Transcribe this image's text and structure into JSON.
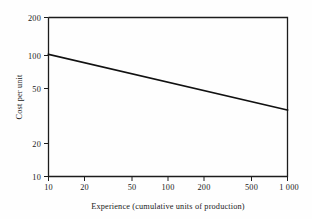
{
  "chart_data": {
    "type": "line",
    "title": "",
    "xlabel": "Experience (cumulative units of production)",
    "ylabel": "Cost per unit",
    "xscale": "log",
    "yscale": "log",
    "xlim": [
      10,
      1000
    ],
    "ylim": [
      10,
      200
    ],
    "grid": false,
    "legend": null,
    "x_ticks": [
      {
        "value": 10,
        "label": "10"
      },
      {
        "value": 20,
        "label": "20"
      },
      {
        "value": 50,
        "label": "50"
      },
      {
        "value": 100,
        "label": "100"
      },
      {
        "value": 200,
        "label": "200"
      },
      {
        "value": 500,
        "label": "500"
      },
      {
        "value": 1000,
        "label": "1 000"
      }
    ],
    "y_ticks": [
      {
        "value": 200,
        "label": "200"
      },
      {
        "value": 100,
        "label": "100"
      },
      {
        "value": 50,
        "label": "50"
      },
      {
        "value": 20,
        "label": "20"
      },
      {
        "value": 10,
        "label": "10"
      }
    ],
    "series": [
      {
        "name": "Experience curve",
        "x": [
          10,
          1000
        ],
        "values": [
          100,
          35
        ]
      }
    ],
    "annotations": []
  },
  "figure": {
    "ylabel_text": "Cost per unit",
    "xlabel_text": "Experience (cumulative units of production)",
    "xtick_0": "10",
    "xtick_1": "20",
    "xtick_2": "50",
    "xtick_3": "100",
    "xtick_4": "200",
    "xtick_5": "500",
    "xtick_6": "1 000",
    "ytick_0": "200",
    "ytick_1": "100",
    "ytick_2": "50",
    "ytick_3": "20",
    "ytick_4": "10"
  },
  "colors": {
    "background": "#fefefe",
    "axis": "#1c1c1c",
    "line": "#111111",
    "text": "#1a1a1a"
  }
}
